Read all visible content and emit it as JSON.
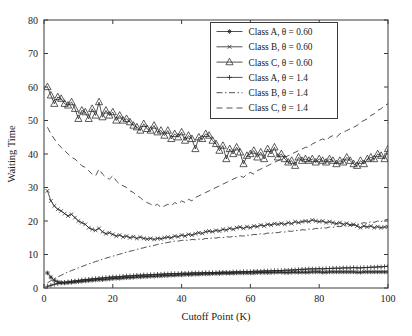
{
  "chart": {
    "type": "line",
    "title": "",
    "xlabel": "Cutoff Point (K)",
    "ylabel": "Waiting Time",
    "xlim": [
      0,
      100
    ],
    "ylim": [
      0,
      80
    ],
    "xticks": [
      "0",
      "20",
      "40",
      "60",
      "80",
      "100"
    ],
    "yticks": [
      "0",
      "10",
      "20",
      "30",
      "40",
      "50",
      "60",
      "70",
      "80"
    ],
    "grid": false,
    "legend_position": "top-right",
    "background": "#ffffff",
    "line_color": "#262626"
  },
  "legend": {
    "items": [
      {
        "label": "Class A, θ = 0.60",
        "marker": "star-marker",
        "dash": "none"
      },
      {
        "label": "Class B, θ = 0.60",
        "marker": "x-cross-marker",
        "dash": "none"
      },
      {
        "label": "Class C, θ = 0.60",
        "marker": "triangle-marker",
        "dash": "none"
      },
      {
        "label": "Class A, θ = 1.4",
        "marker": "plus-marker",
        "dash": "none"
      },
      {
        "label": "Class B, θ = 1.4",
        "marker": "none",
        "dash": "dash-dot"
      },
      {
        "label": "Class C, θ = 1.4",
        "marker": "none",
        "dash": "dashed"
      }
    ]
  },
  "chart_data": {
    "type": "line",
    "title": "",
    "xlabel": "Cutoff Point (K)",
    "ylabel": "Waiting Time",
    "xlim": [
      0,
      100
    ],
    "ylim": [
      0,
      80
    ],
    "xticks": [
      0,
      20,
      40,
      60,
      80,
      100
    ],
    "yticks": [
      0,
      10,
      20,
      30,
      40,
      50,
      60,
      70,
      80
    ],
    "grid": false,
    "legend_position": "top-right",
    "x": [
      1,
      2,
      3,
      4,
      5,
      6,
      7,
      8,
      9,
      10,
      11,
      12,
      13,
      14,
      15,
      16,
      17,
      18,
      19,
      20,
      21,
      22,
      23,
      24,
      25,
      26,
      27,
      28,
      29,
      30,
      31,
      32,
      33,
      34,
      35,
      36,
      37,
      38,
      39,
      40,
      41,
      42,
      43,
      44,
      45,
      46,
      47,
      48,
      49,
      50,
      51,
      52,
      53,
      54,
      55,
      56,
      57,
      58,
      59,
      60,
      61,
      62,
      63,
      64,
      65,
      66,
      67,
      68,
      69,
      70,
      71,
      72,
      73,
      74,
      75,
      76,
      77,
      78,
      79,
      80,
      81,
      82,
      83,
      84,
      85,
      86,
      87,
      88,
      89,
      90,
      91,
      92,
      93,
      94,
      95,
      96,
      97,
      98,
      99,
      100
    ],
    "series": [
      {
        "name": "Class A, θ = 0.60",
        "marker": "star",
        "dash": "solid",
        "values": [
          4.5,
          3.2,
          2.3,
          1.8,
          1.6,
          1.5,
          1.6,
          1.7,
          1.8,
          1.9,
          2.0,
          2.1,
          2.2,
          2.3,
          2.4,
          2.5,
          2.5,
          2.6,
          2.7,
          2.8,
          2.9,
          2.9,
          3.0,
          3.1,
          3.1,
          3.2,
          3.3,
          3.3,
          3.4,
          3.4,
          3.5,
          3.5,
          3.6,
          3.6,
          3.7,
          3.7,
          3.8,
          3.8,
          3.9,
          3.9,
          4.0,
          4.0,
          4.0,
          4.1,
          4.1,
          4.2,
          4.2,
          4.2,
          4.3,
          4.3,
          4.3,
          4.4,
          4.4,
          4.4,
          4.4,
          4.5,
          4.5,
          4.5,
          4.5,
          4.5,
          4.5,
          4.6,
          4.6,
          4.6,
          4.6,
          4.6,
          4.7,
          4.7,
          4.7,
          4.6,
          4.6,
          4.7,
          4.7,
          4.7,
          4.7,
          4.7,
          4.7,
          4.8,
          4.8,
          4.8,
          4.7,
          4.7,
          4.8,
          4.8,
          4.8,
          4.8,
          4.8,
          4.8,
          4.8,
          4.8,
          4.7,
          4.7,
          4.8,
          4.8,
          4.8,
          4.8,
          4.8,
          4.8,
          4.8,
          4.8
        ]
      },
      {
        "name": "Class B, θ = 0.60",
        "marker": "x-cross",
        "dash": "solid",
        "values": [
          29.0,
          26.0,
          24.5,
          23.5,
          23.0,
          22.2,
          21.5,
          22.0,
          21.0,
          20.0,
          19.5,
          19.0,
          18.0,
          17.5,
          17.2,
          17.8,
          16.8,
          16.2,
          16.5,
          16.0,
          15.5,
          15.8,
          15.2,
          15.5,
          15.0,
          15.3,
          14.8,
          15.2,
          14.8,
          14.6,
          14.8,
          14.5,
          14.8,
          14.7,
          15.0,
          15.2,
          15.0,
          15.5,
          15.3,
          15.8,
          15.5,
          16.0,
          15.8,
          16.2,
          16.5,
          16.3,
          16.8,
          17.0,
          16.8,
          17.2,
          17.0,
          17.5,
          17.3,
          17.8,
          17.5,
          18.0,
          18.2,
          17.8,
          18.3,
          18.0,
          18.5,
          18.3,
          18.8,
          18.5,
          19.0,
          18.8,
          19.2,
          19.0,
          19.3,
          19.0,
          19.5,
          19.2,
          19.8,
          19.5,
          19.8,
          20.0,
          19.8,
          20.3,
          20.0,
          19.8,
          20.0,
          19.5,
          19.8,
          19.5,
          19.2,
          19.5,
          19.0,
          19.3,
          18.8,
          19.0,
          18.5,
          18.0,
          18.5,
          18.2,
          18.5,
          18.0,
          18.3,
          18.0,
          18.2,
          18.3
        ]
      },
      {
        "name": "Class C, θ = 0.60",
        "marker": "triangle",
        "dash": "solid",
        "values": [
          60.0,
          57.5,
          55.0,
          57.0,
          56.5,
          55.0,
          54.5,
          55.5,
          53.5,
          50.5,
          53.0,
          52.5,
          50.5,
          53.5,
          51.5,
          55.5,
          51.0,
          53.0,
          51.5,
          52.5,
          50.0,
          51.5,
          50.0,
          50.5,
          49.5,
          48.5,
          48.0,
          47.0,
          49.0,
          47.5,
          47.0,
          48.5,
          46.5,
          47.0,
          45.5,
          47.0,
          44.5,
          46.0,
          45.0,
          46.5,
          44.0,
          45.5,
          44.5,
          41.5,
          45.0,
          44.5,
          46.0,
          45.5,
          44.0,
          43.0,
          41.0,
          42.5,
          38.5,
          41.5,
          40.0,
          42.0,
          40.5,
          37.0,
          39.5,
          40.0,
          41.0,
          39.0,
          40.5,
          38.5,
          41.5,
          40.0,
          42.0,
          39.0,
          40.0,
          38.5,
          37.5,
          38.0,
          36.5,
          39.0,
          38.0,
          38.5,
          38.0,
          38.5,
          37.5,
          38.5,
          38.0,
          37.5,
          38.5,
          38.0,
          37.0,
          38.0,
          37.5,
          39.0,
          38.0,
          37.0,
          36.5,
          38.0,
          37.0,
          38.5,
          39.0,
          38.5,
          40.0,
          39.5,
          38.5,
          41.5
        ]
      },
      {
        "name": "Class A, θ = 1.4",
        "marker": "plus",
        "dash": "solid",
        "values": [
          0.5,
          0.8,
          1.1,
          1.3,
          1.5,
          1.7,
          1.8,
          2.0,
          2.1,
          2.2,
          2.4,
          2.5,
          2.6,
          2.7,
          2.8,
          2.9,
          3.0,
          3.1,
          3.2,
          3.3,
          3.3,
          3.4,
          3.5,
          3.6,
          3.6,
          3.7,
          3.8,
          3.8,
          3.9,
          3.9,
          4.0,
          4.0,
          4.1,
          4.1,
          4.2,
          4.2,
          4.3,
          4.3,
          4.3,
          4.4,
          4.4,
          4.4,
          4.5,
          4.5,
          4.5,
          4.5,
          4.6,
          4.6,
          4.6,
          4.6,
          4.7,
          4.7,
          4.7,
          4.7,
          4.8,
          4.8,
          4.8,
          4.9,
          4.9,
          4.9,
          5.0,
          5.0,
          5.0,
          5.1,
          5.1,
          5.1,
          5.2,
          5.2,
          5.2,
          5.3,
          5.3,
          5.4,
          5.4,
          5.5,
          5.6,
          5.6,
          5.7,
          5.7,
          5.7,
          5.8,
          5.7,
          5.8,
          5.8,
          5.9,
          5.9,
          5.9,
          6.0,
          6.0,
          6.0,
          6.1,
          6.0,
          6.0,
          6.1,
          6.1,
          6.2,
          6.2,
          6.3,
          6.3,
          6.4,
          6.5
        ]
      },
      {
        "name": "Class B, θ = 1.4",
        "marker": "none",
        "dash": "dash-dot",
        "values": [
          1.5,
          2.2,
          2.8,
          3.3,
          3.8,
          4.3,
          4.8,
          5.2,
          5.6,
          6.0,
          6.4,
          6.8,
          7.2,
          7.5,
          7.9,
          8.2,
          8.6,
          8.9,
          9.2,
          9.5,
          9.8,
          10.1,
          10.4,
          10.7,
          11.0,
          11.2,
          11.5,
          11.8,
          12.0,
          12.3,
          12.5,
          12.7,
          13.0,
          13.2,
          13.4,
          13.6,
          13.8,
          14.0,
          14.0,
          14.2,
          14.3,
          14.2,
          14.5,
          14.4,
          14.6,
          14.5,
          14.8,
          14.7,
          15.0,
          14.9,
          15.1,
          15.0,
          15.3,
          15.2,
          15.4,
          15.3,
          15.6,
          15.5,
          15.8,
          15.7,
          16.0,
          15.9,
          16.2,
          16.1,
          16.4,
          16.3,
          16.6,
          16.5,
          16.8,
          16.7,
          17.0,
          16.9,
          17.2,
          17.1,
          17.4,
          17.3,
          17.6,
          17.5,
          17.8,
          17.7,
          18.0,
          17.9,
          18.2,
          18.1,
          18.4,
          18.3,
          18.6,
          18.5,
          18.8,
          18.7,
          19.0,
          19.2,
          19.5,
          19.3,
          19.8,
          19.6,
          20.0,
          19.8,
          20.3,
          20.5
        ]
      },
      {
        "name": "Class C, θ = 1.4",
        "marker": "none",
        "dash": "dashed",
        "values": [
          48.0,
          46.0,
          44.5,
          43.0,
          42.0,
          41.0,
          40.0,
          39.0,
          38.5,
          37.5,
          36.5,
          36.0,
          35.0,
          34.0,
          33.5,
          35.5,
          34.0,
          33.0,
          32.5,
          33.5,
          32.0,
          31.0,
          30.5,
          30.0,
          29.0,
          28.5,
          27.5,
          27.0,
          26.0,
          25.5,
          25.0,
          24.5,
          25.0,
          24.0,
          24.5,
          25.0,
          24.5,
          25.5,
          25.0,
          26.0,
          25.5,
          26.5,
          26.0,
          27.0,
          27.5,
          28.0,
          28.5,
          29.0,
          29.5,
          30.0,
          30.5,
          31.0,
          31.5,
          32.0,
          32.5,
          33.0,
          33.5,
          33.0,
          34.0,
          34.5,
          34.0,
          35.0,
          35.5,
          36.0,
          36.5,
          37.0,
          37.5,
          38.0,
          38.5,
          39.0,
          39.5,
          40.0,
          40.5,
          41.0,
          41.5,
          42.0,
          42.0,
          43.0,
          43.5,
          44.0,
          44.5,
          44.0,
          45.0,
          45.5,
          45.0,
          46.0,
          46.5,
          47.0,
          47.5,
          48.0,
          48.5,
          49.5,
          50.0,
          50.5,
          51.5,
          52.0,
          53.0,
          53.5,
          54.5,
          55.0
        ]
      }
    ]
  }
}
